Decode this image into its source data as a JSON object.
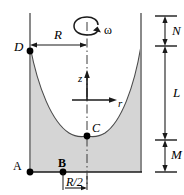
{
  "figure": {
    "type": "engineering-diagram",
    "width": 184,
    "height": 195,
    "colors": {
      "line": "#1a1a1a",
      "fill": "#d4d4d4",
      "background": "#ffffff",
      "wall": "#8c8c8c"
    },
    "labels": {
      "point_a": "A",
      "point_b": "B",
      "point_c": "C",
      "point_d": "D",
      "radius": "R",
      "half_radius": "R/2",
      "omega": "ω",
      "axis_z": "z",
      "axis_r": "r",
      "dim_n": "N",
      "dim_l": "L",
      "dim_m": "M"
    },
    "geometry": {
      "left_wall_x": 30,
      "right_wall_x": 141,
      "bottom_y": 172,
      "top_y": 13,
      "center_x": 87,
      "vertex_y": 136,
      "rim_y": 46,
      "origin_y": 100,
      "point_b_x": 63
    },
    "dimension_ticks": {
      "n_top": 16,
      "n_bottom": 46,
      "l_bottom": 140,
      "m_bottom": 172,
      "dim_x": 165
    }
  }
}
